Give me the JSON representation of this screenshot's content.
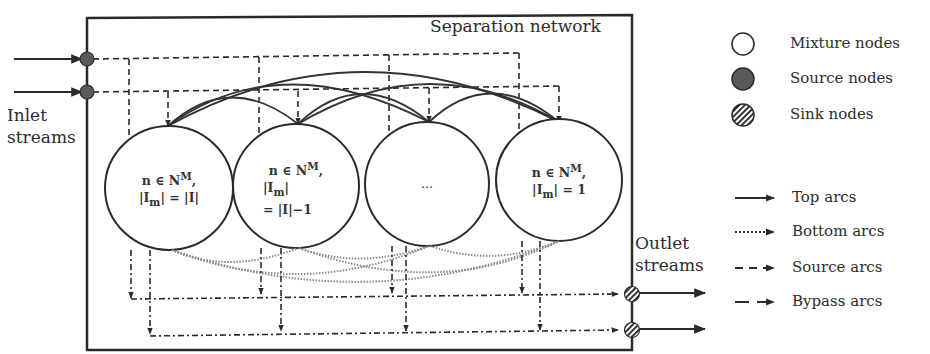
{
  "diagram": {
    "title": "Separation network",
    "inlet_label_1": "Inlet",
    "inlet_label_2": "streams",
    "outlet_label_1": "Outlet",
    "outlet_label_2": "streams",
    "nodes": [
      {
        "line1": "n ∈ N",
        "sup": "M",
        "line1_tail": ",",
        "line2": "|I",
        "sub": "m",
        "line2_tail": "| = |I|",
        "line3": ""
      },
      {
        "line1": "n ∈ N",
        "sup": "M",
        "line1_tail": ",",
        "line2": "|I",
        "sub": "m",
        "line2_tail": "|",
        "line3": "= |I|−1"
      },
      {
        "line1": "…",
        "sup": "",
        "line1_tail": "",
        "line2": "",
        "sub": "",
        "line2_tail": "",
        "line3": ""
      },
      {
        "line1": "n ∈ N",
        "sup": "M",
        "line1_tail": ",",
        "line2": "|I",
        "sub": "m",
        "line2_tail": "| = 1",
        "line3": ""
      }
    ]
  },
  "legend": {
    "nodes": [
      {
        "icon": "mixture-node-icon",
        "label": "Mixture nodes"
      },
      {
        "icon": "source-node-icon",
        "label": "Source nodes"
      },
      {
        "icon": "sink-node-icon",
        "label": "Sink nodes"
      }
    ],
    "arcs": [
      {
        "icon": "top-arc-icon",
        "label": "Top arcs"
      },
      {
        "icon": "bottom-arc-icon",
        "label": "Bottom arcs"
      },
      {
        "icon": "source-arc-icon",
        "label": "Source arcs"
      },
      {
        "icon": "bypass-arc-icon",
        "label": "Bypass arcs"
      }
    ]
  },
  "colors": {
    "line": "#2a2a2a",
    "source_fill": "#555555",
    "bottom_arc": "#8a8a8a"
  }
}
